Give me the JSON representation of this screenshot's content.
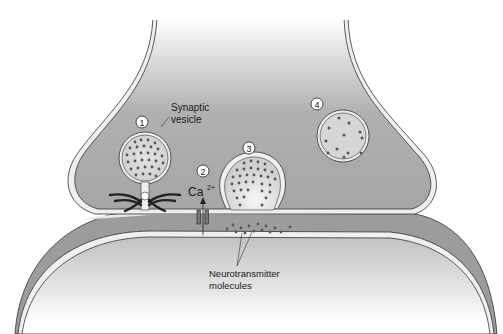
{
  "diagram": {
    "labels": {
      "synaptic_vesicle_line1": "Synaptic",
      "synaptic_vesicle_line2": "vesicle",
      "calcium_base": "Ca",
      "calcium_charge": "2+",
      "neurotransmitter_line1": "Neurotransmitter",
      "neurotransmitter_line2": "molecules"
    },
    "step_markers": [
      "1",
      "2",
      "3",
      "4"
    ],
    "colors": {
      "terminal_fill": "#a9a9a9",
      "membrane_light": "#efefef",
      "membrane_outline": "#333333",
      "vesicle_fill": "#d9d9d9",
      "molecule_dot": "#555555",
      "postsynaptic_top": "#c4c4c4",
      "background": "#ffffff"
    }
  }
}
